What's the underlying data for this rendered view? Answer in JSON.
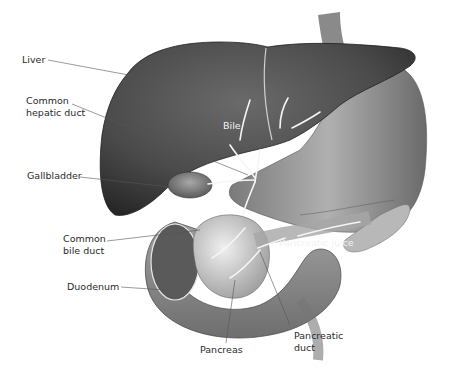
{
  "diagram": {
    "type": "anatomical-illustration",
    "colors": {
      "background": "#ffffff",
      "liver": "#4a4a4a",
      "stomach": "#9a9a9a",
      "pancreas": "#cfcfcf",
      "duodenum": "#8a8a8a",
      "flow_arrows": "#f5f5f5",
      "leader_lines": "#555555",
      "label_text": "#2a2a2a"
    }
  },
  "labels": {
    "liver": "Liver",
    "common_hepatic_duct": "Common\nhepatic duct",
    "gallbladder": "Gallbladder",
    "common_bile_duct": "Common\nbile duct",
    "duodenum": "Duodenum",
    "pancreas": "Pancreas",
    "pancreatic_duct": "Pancreatic\nduct",
    "bile": "Bile",
    "pancreatic_juice": "Pancreatic juice"
  }
}
